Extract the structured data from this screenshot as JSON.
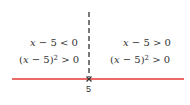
{
  "diagram": {
    "type": "sign-chart",
    "number_line": {
      "color": "#e53935",
      "critical_point": "5"
    },
    "regions": [
      {
        "side": "left",
        "factor": {
          "var": "x",
          "rest": " − 5 < 0"
        },
        "square": {
          "open": "(",
          "var": "x",
          "inner": " − 5)",
          "exp": "2",
          "rest": " > 0"
        }
      },
      {
        "side": "right",
        "factor": {
          "var": "x",
          "rest": " − 5 > 0"
        },
        "square": {
          "open": "(",
          "var": "x",
          "inner": " − 5)",
          "exp": "2",
          "rest": " > 0"
        }
      }
    ]
  }
}
